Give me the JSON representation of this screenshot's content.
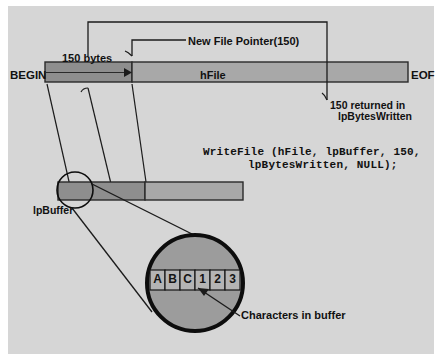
{
  "figure": {
    "panel_bg": "#d6d6d6",
    "ink": "#111111"
  },
  "file_bar": {
    "begin_label": "BEGIN",
    "eof_label": "EOF",
    "handle_label": "hFile",
    "written_label": "150 bytes",
    "written_fill": "#8e8e8e",
    "remaining_fill": "#a8a8a8",
    "bar_left_px": 45,
    "bar_right_px": 408,
    "pointer_x_px": 132
  },
  "callouts": {
    "new_file_pointer": "New File Pointer(150)",
    "returned_line1": "150 returned in",
    "returned_line2": "lpBytesWritten",
    "buffer_label": "lpBuffer",
    "characters_label": "Characters in buffer"
  },
  "code": {
    "line1": "WriteFile (hFile, lpBuffer, 150,",
    "line2": "lpBytesWritten, NULL);"
  },
  "buffer_bar": {
    "used_fill": "#8e8e8e",
    "free_fill": "#a8a8a8",
    "left_px": 58,
    "right_px": 243,
    "split_px": 145
  },
  "magnifier": {
    "small_circle": {
      "cx": 75,
      "cy": 190,
      "r": 18
    },
    "big_circle": {
      "cx": 195,
      "cy": 283,
      "r": 48
    },
    "fill": "#9c9c9c",
    "stroke": "#0d0d0d"
  },
  "buffer_cells": {
    "values": [
      "A",
      "B",
      "C",
      "1",
      "2",
      "3"
    ],
    "cell_fill": "#b4b4b4",
    "strip_left_px": 150,
    "strip_top_px": 270,
    "cell_w_px": 15,
    "cell_h_px": 20
  }
}
